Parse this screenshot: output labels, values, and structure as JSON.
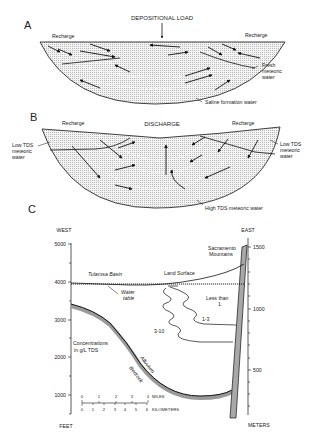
{
  "figure": {
    "panels": {
      "A": {
        "letter": "A",
        "title": "DEPOSITIONAL LOAD",
        "recharge_left": "Recharge",
        "recharge_right": "Recharge",
        "fresh": [
          "Fresh",
          "meteoric",
          "water"
        ],
        "saline": "Saline formation water"
      },
      "B": {
        "letter": "B",
        "title": "DISCHARGE",
        "recharge_left": "Recharge",
        "recharge_right": "Recharge",
        "low_tds_left": [
          "Low TDS",
          "meteoric",
          "water"
        ],
        "low_tds_right": [
          "Low TDS",
          "meteoric",
          "water"
        ],
        "high_tds": "High TDS meteoric water"
      },
      "C": {
        "letter": "C",
        "west": "WEST",
        "east": "EAST",
        "left_axis_unit": "FEET",
        "right_axis_unit": "METERS",
        "left_ticks": [
          "5000",
          "4000",
          "3000",
          "2000",
          "1000"
        ],
        "right_ticks": [
          "1500",
          "1000",
          "500"
        ],
        "tularosa": "Tularosa  Basin",
        "water_table": [
          "Water",
          "table"
        ],
        "land_surface": "Land  Surface",
        "sacramento": [
          "Sacramento",
          "Mountains"
        ],
        "less_than": [
          "Less  than",
          "1"
        ],
        "zone_1_3": "1-3",
        "zone_3_10": "3-10",
        "concentrations": [
          "Concentrations",
          "in  g/L  TDS"
        ],
        "alluvium": "Alluvium",
        "bedrock": "Bedrock",
        "scale_miles": {
          "ticks": [
            "0",
            "1",
            "2",
            "3",
            "4"
          ],
          "unit": "MILES"
        },
        "scale_km": {
          "ticks": [
            "0",
            "1",
            "2",
            "3",
            "4",
            "5",
            "6"
          ],
          "unit": "KILOMETERS"
        }
      }
    }
  }
}
